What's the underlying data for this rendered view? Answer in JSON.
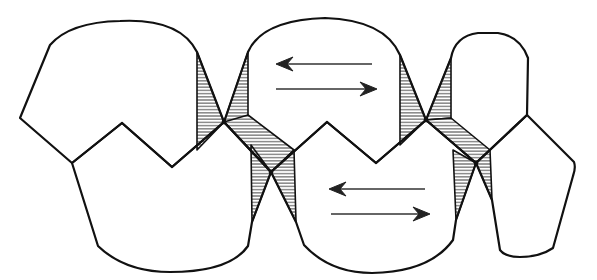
{
  "figure": {
    "colors": {
      "line": "#111111",
      "background": "#ffffff",
      "hatch": "#333333"
    },
    "cells": [
      {
        "id": "upper-left",
        "row": "top"
      },
      {
        "id": "upper-middle",
        "row": "top",
        "contains_arrows": true
      },
      {
        "id": "upper-right",
        "row": "top"
      },
      {
        "id": "lower-left",
        "row": "bottom"
      },
      {
        "id": "lower-middle",
        "row": "bottom",
        "contains_arrows": true
      },
      {
        "id": "lower-right",
        "row": "bottom"
      }
    ],
    "hatched_junctions": 2,
    "arrow_pairs": [
      {
        "cell": "upper-middle",
        "arrows": [
          "left",
          "right"
        ]
      },
      {
        "cell": "lower-middle",
        "arrows": [
          "left",
          "right"
        ]
      }
    ]
  }
}
